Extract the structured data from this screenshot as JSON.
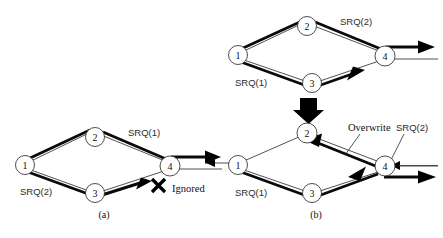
{
  "figure": {
    "panels": [
      {
        "id": "a",
        "caption": "(a)",
        "nodes": [
          {
            "id": "n1",
            "label": "1",
            "cx": 25,
            "cy": 165
          },
          {
            "id": "n2",
            "label": "2",
            "cx": 95,
            "cy": 137
          },
          {
            "id": "n3",
            "label": "3",
            "cx": 95,
            "cy": 193
          },
          {
            "id": "n4",
            "label": "4",
            "cx": 170,
            "cy": 166
          }
        ],
        "labels": [
          {
            "id": "srq1",
            "text": "SRQ(1)",
            "x": 128,
            "y": 136
          },
          {
            "id": "srq2",
            "text": "SRQ(2)",
            "x": 20,
            "y": 195
          },
          {
            "id": "ignored",
            "text": "Ignored",
            "x": 172,
            "y": 192
          }
        ],
        "marks": [
          {
            "id": "x-mark",
            "type": "cross",
            "x": 158,
            "y": 185
          }
        ]
      },
      {
        "id": "b-top",
        "caption": "",
        "nodes": [
          {
            "id": "n1",
            "label": "1",
            "cx": 238,
            "cy": 55
          },
          {
            "id": "n2",
            "label": "2",
            "cx": 307,
            "cy": 26
          },
          {
            "id": "n3",
            "label": "3",
            "cx": 312,
            "cy": 83
          },
          {
            "id": "n4",
            "label": "4",
            "cx": 385,
            "cy": 56
          }
        ],
        "labels": [
          {
            "id": "srq2",
            "text": "SRQ(2)",
            "x": 340,
            "y": 25
          },
          {
            "id": "srq1",
            "text": "SRQ(1)",
            "x": 235,
            "y": 86
          }
        ],
        "marks": []
      },
      {
        "id": "b-bottom",
        "caption": "(b)",
        "nodes": [
          {
            "id": "n1",
            "label": "1",
            "cx": 238,
            "cy": 165
          },
          {
            "id": "n2",
            "label": "2",
            "cx": 307,
            "cy": 133
          },
          {
            "id": "n3",
            "label": "3",
            "cx": 312,
            "cy": 193
          },
          {
            "id": "n4",
            "label": "4",
            "cx": 385,
            "cy": 166
          }
        ],
        "labels": [
          {
            "id": "overwrite",
            "text": "Overwrite",
            "x": 348,
            "y": 131
          },
          {
            "id": "srq2",
            "text": "SRQ(2)",
            "x": 396,
            "y": 131
          },
          {
            "id": "srq1",
            "text": "SRQ(1)",
            "x": 235,
            "y": 196
          }
        ],
        "marks": []
      }
    ],
    "transition": {
      "id": "down-arrow",
      "name": "block-down-arrow",
      "x": 305,
      "y": 100
    }
  }
}
